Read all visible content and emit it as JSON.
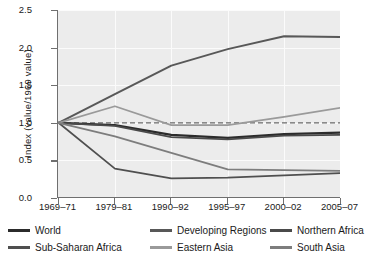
{
  "chart_data": {
    "type": "line",
    "title": "",
    "xlabel": "",
    "ylabel": "Index  (value/1969 value)",
    "categories": [
      "1969–71",
      "1979–81",
      "1990–92",
      "1995–97",
      "2000–02",
      "2005–07"
    ],
    "ylim": [
      0.0,
      2.5
    ],
    "yticks": [
      "0.0",
      "0.5",
      "1.0",
      "1.5",
      "2.0",
      "2.5"
    ],
    "ytick_values": [
      0.0,
      0.5,
      1.0,
      1.5,
      2.0,
      2.5
    ],
    "grid": true,
    "legend_position": "bottom",
    "reference_line": {
      "value": 1.0,
      "style": "dashed",
      "color": "#6a6a6a"
    },
    "series": [
      {
        "name": "World",
        "color": "#2b2b2b",
        "width": 2.2,
        "values": [
          1.0,
          0.97,
          0.84,
          0.8,
          0.85,
          0.87
        ]
      },
      {
        "name": "Developing Regions",
        "color": "#585858",
        "width": 2.0,
        "values": [
          1.0,
          1.38,
          1.76,
          1.98,
          2.15,
          2.14
        ]
      },
      {
        "name": "Northern Africa",
        "color": "#4a4a4a",
        "width": 1.8,
        "values": [
          1.0,
          0.96,
          0.81,
          0.78,
          0.83,
          0.84
        ]
      },
      {
        "name": "Sub-Saharan Africa",
        "color": "#4f4f4f",
        "width": 1.8,
        "values": [
          1.0,
          0.39,
          0.26,
          0.27,
          0.3,
          0.33
        ]
      },
      {
        "name": "Eastern Asia",
        "color": "#9a9a9a",
        "width": 1.8,
        "values": [
          1.0,
          1.22,
          0.97,
          0.97,
          1.08,
          1.2
        ]
      },
      {
        "name": "South Asia",
        "color": "#7d7d7d",
        "width": 1.8,
        "values": [
          1.0,
          0.82,
          0.6,
          0.38,
          0.37,
          0.36
        ]
      }
    ]
  },
  "legend": {
    "rows": [
      [
        {
          "label": "World",
          "color": "#2b2b2b",
          "x": 0
        },
        {
          "label": "Developing Regions",
          "color": "#585858",
          "x": 142
        },
        {
          "label": "Northern Africa",
          "color": "#4a4a4a",
          "x": 262
        }
      ],
      [
        {
          "label": "Sub-Saharan Africa",
          "color": "#4f4f4f",
          "x": 0
        },
        {
          "label": "Eastern Asia",
          "color": "#9a9a9a",
          "x": 142
        },
        {
          "label": "South Asia",
          "color": "#7d7d7d",
          "x": 262
        }
      ]
    ]
  },
  "axes": {
    "y_title": "Index  (value/1969 value)"
  }
}
